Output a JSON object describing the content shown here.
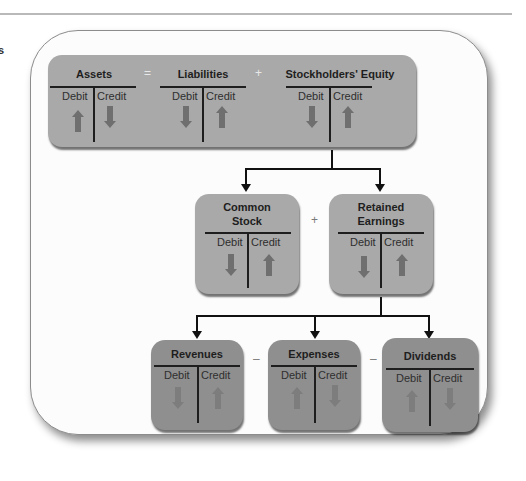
{
  "edge_fragment": "s",
  "colors": {
    "box_light": "#a9a9a9",
    "box_dark": "#8f8f8f",
    "arrow": "#6f6f6f",
    "line": "#111111"
  },
  "top_row": {
    "accounts": [
      {
        "title": "Assets",
        "debit_label": "Debit",
        "credit_label": "Credit",
        "debit_arrow": "up",
        "credit_arrow": "down"
      },
      {
        "title": "Liabilities",
        "debit_label": "Debit",
        "credit_label": "Credit",
        "debit_arrow": "down",
        "credit_arrow": "up"
      },
      {
        "title": "Stockholders' Equity",
        "debit_label": "Debit",
        "credit_label": "Credit",
        "debit_arrow": "down",
        "credit_arrow": "up"
      }
    ],
    "operators": [
      "=",
      "+"
    ]
  },
  "middle_row": {
    "accounts": [
      {
        "title_line1": "Common",
        "title_line2": "Stock",
        "debit_label": "Debit",
        "credit_label": "Credit",
        "debit_arrow": "down",
        "credit_arrow": "up"
      },
      {
        "title_line1": "Retained",
        "title_line2": "Earnings",
        "debit_label": "Debit",
        "credit_label": "Credit",
        "debit_arrow": "down",
        "credit_arrow": "up"
      }
    ],
    "operators": [
      "+"
    ]
  },
  "bottom_row": {
    "accounts": [
      {
        "title": "Revenues",
        "debit_label": "Debit",
        "credit_label": "Credit",
        "debit_arrow": "down",
        "credit_arrow": "up"
      },
      {
        "title": "Expenses",
        "debit_label": "Debit",
        "credit_label": "Credit",
        "debit_arrow": "up",
        "credit_arrow": "down"
      },
      {
        "title": "Dividends",
        "debit_label": "Debit",
        "credit_label": "Credit",
        "debit_arrow": "up",
        "credit_arrow": "down"
      }
    ],
    "operators": [
      "–",
      "–"
    ]
  }
}
